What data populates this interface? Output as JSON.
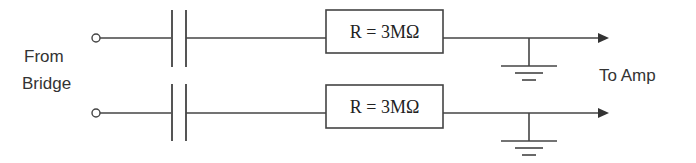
{
  "diagram": {
    "type": "circuit-schematic",
    "input_label_line1": "From",
    "input_label_line2": "Bridge",
    "output_label": "To Amp",
    "channels": [
      {
        "name": "top",
        "resistor_label": "R = 3MΩ",
        "components": [
          "input-terminal",
          "capacitor",
          "resistor",
          "ground",
          "output-arrow"
        ]
      },
      {
        "name": "bottom",
        "resistor_label": "R = 3MΩ",
        "components": [
          "input-terminal",
          "capacitor",
          "resistor",
          "ground",
          "output-arrow"
        ]
      }
    ],
    "colors": {
      "line": "#444444",
      "text": "#333333",
      "background": "#ffffff"
    }
  }
}
